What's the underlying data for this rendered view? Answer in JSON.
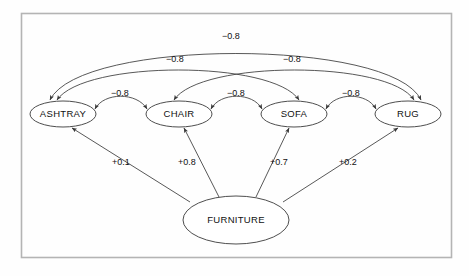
{
  "diagram": {
    "title": "",
    "frame": {
      "visible": true,
      "color": "#b4b4b4"
    },
    "colors": {
      "node_stroke": "#3a3a3a",
      "node_fill": "#ffffff",
      "edge_stroke": "#3a3a3a",
      "text": "#111111",
      "background": "#fefefe"
    },
    "nodes": [
      {
        "id": "ashtray",
        "label": "ASHTRAY",
        "cx": 63,
        "cy": 114,
        "rx": 33,
        "ry": 13
      },
      {
        "id": "chair",
        "label": "CHAIR",
        "cx": 179,
        "cy": 114,
        "rx": 33,
        "ry": 13
      },
      {
        "id": "sofa",
        "label": "SOFA",
        "cx": 294,
        "cy": 114,
        "rx": 33,
        "ry": 13
      },
      {
        "id": "rug",
        "label": "RUG",
        "cx": 408,
        "cy": 114,
        "rx": 33,
        "ry": 13
      },
      {
        "id": "furniture",
        "label": "FURNITURE",
        "cx": 236,
        "cy": 220,
        "rx": 53,
        "ry": 24
      }
    ],
    "edges": [
      {
        "id": "ashtray-chair",
        "from": "ashtray",
        "to": "chair",
        "label": "−0.8",
        "arrows": "both",
        "label_x": 120,
        "label_y": 95
      },
      {
        "id": "chair-sofa",
        "from": "chair",
        "to": "sofa",
        "label": "−0.8",
        "arrows": "both",
        "label_x": 236,
        "label_y": 95
      },
      {
        "id": "sofa-rug",
        "from": "sofa",
        "to": "rug",
        "label": "−0.8",
        "arrows": "both",
        "label_x": 351,
        "label_y": 95
      },
      {
        "id": "ashtray-sofa",
        "from": "ashtray",
        "to": "sofa",
        "label": "−0.8",
        "arrows": "both",
        "label_x": 175,
        "label_y": 60
      },
      {
        "id": "chair-rug",
        "from": "chair",
        "to": "rug",
        "label": "−0.8",
        "arrows": "both",
        "label_x": 292,
        "label_y": 60
      },
      {
        "id": "ashtray-rug",
        "from": "ashtray",
        "to": "rug",
        "label": "−0.8",
        "arrows": "both",
        "label_x": 231,
        "label_y": 37
      },
      {
        "id": "furniture-ashtray",
        "from": "furniture",
        "to": "ashtray",
        "label": "+0.1",
        "arrows": "to",
        "label_x": 121,
        "label_y": 163
      },
      {
        "id": "furniture-chair",
        "from": "furniture",
        "to": "chair",
        "label": "+0.8",
        "arrows": "to",
        "label_x": 187,
        "label_y": 163
      },
      {
        "id": "furniture-sofa",
        "from": "furniture",
        "to": "sofa",
        "label": "+0.7",
        "arrows": "to",
        "label_x": 279,
        "label_y": 163
      },
      {
        "id": "furniture-rug",
        "from": "furniture",
        "to": "rug",
        "label": "+0.2",
        "arrows": "to",
        "label_x": 348,
        "label_y": 163
      }
    ]
  }
}
